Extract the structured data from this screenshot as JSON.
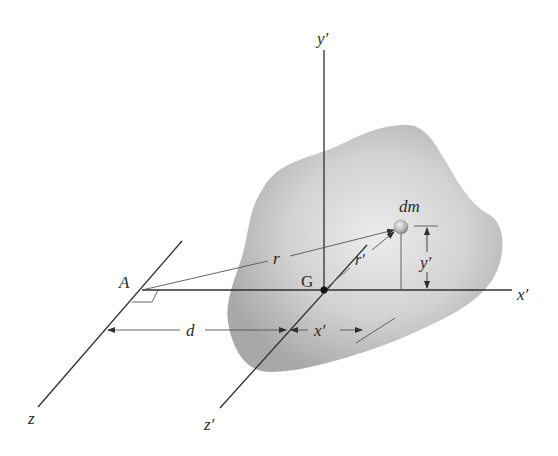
{
  "figure": {
    "colors": {
      "background": "#ffffff",
      "body_fill_light": "#e6e6e6",
      "body_fill_dark": "#a9a9a9",
      "lines": "#2f2f2f",
      "thin_lines": "#555555"
    }
  },
  "labels": {
    "y_prime_axis": "y′",
    "x_prime_axis": "x′",
    "z_prime_axis": "z′",
    "z_axis": "z",
    "point_A": "A",
    "point_G": "G",
    "mass_element": "dm",
    "r": "r",
    "r_prime": "r′",
    "y_prime_dim": "y′",
    "x_prime_dim": "x′",
    "d_dim": "d"
  }
}
